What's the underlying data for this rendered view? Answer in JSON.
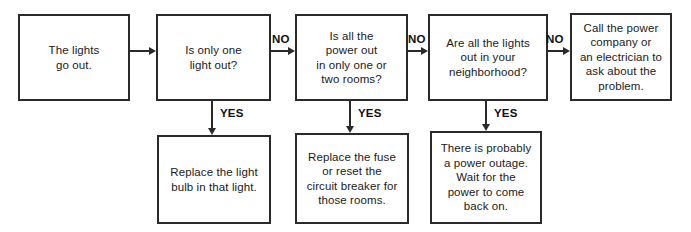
{
  "diagram": {
    "background_color": "#ffffff",
    "line_color": "#2a2a2a",
    "text_color": "#1a1a1a"
  },
  "nodes": [
    {
      "id": "lights-go-out",
      "text": "The lights\ngo out.",
      "x": 18,
      "y": 14,
      "w": 112,
      "h": 87
    },
    {
      "id": "is-only-one-light-out",
      "text": "Is only one\nlight out?",
      "x": 156,
      "y": 14,
      "w": 115,
      "h": 87
    },
    {
      "id": "is-all-power-out-rooms",
      "text": "Is all the\npower out\nin only one or\ntwo rooms?",
      "x": 295,
      "y": 14,
      "w": 113,
      "h": 87
    },
    {
      "id": "are-all-lights-out-neighborhood",
      "text": "Are all the lights\nout in your\nneighborhood?",
      "x": 428,
      "y": 14,
      "w": 120,
      "h": 87
    },
    {
      "id": "call-power-company",
      "text": "Call the power\ncompany or\nan electrician to\nask about the\nproblem.",
      "x": 570,
      "y": 13,
      "w": 102,
      "h": 88
    },
    {
      "id": "replace-light-bulb",
      "text": "Replace the light\nbulb in that light.",
      "x": 157,
      "y": 135,
      "w": 114,
      "h": 89
    },
    {
      "id": "replace-fuse-reset-breaker",
      "text": "Replace the fuse\nor reset the\ncircuit breaker for\nthose rooms.",
      "x": 295,
      "y": 133,
      "w": 114,
      "h": 91
    },
    {
      "id": "power-outage-wait",
      "text": "There is probably\na power outage.\nWait for the\npower to come\nback on.",
      "x": 430,
      "y": 131,
      "w": 112,
      "h": 93
    }
  ],
  "edges": [
    {
      "id": "edge-start-to-q1",
      "label": "",
      "direction": "right",
      "x": 130,
      "y": 51,
      "length": 26
    },
    {
      "id": "edge-q1-no-to-q2",
      "label": "NO",
      "direction": "right",
      "x": 271,
      "y": 51,
      "length": 24,
      "label_x": 272,
      "label_y": 33
    },
    {
      "id": "edge-q2-no-to-q3",
      "label": "NO",
      "direction": "right",
      "x": 408,
      "y": 51,
      "length": 20,
      "label_x": 408,
      "label_y": 33
    },
    {
      "id": "edge-q3-no-to-call",
      "label": "NO",
      "direction": "right",
      "x": 548,
      "y": 51,
      "length": 22,
      "label_x": 546,
      "label_y": 33
    },
    {
      "id": "edge-q1-yes-to-bulb",
      "label": "YES",
      "direction": "down",
      "x": 212,
      "y": 101,
      "length": 34,
      "label_x": 220,
      "label_y": 107
    },
    {
      "id": "edge-q2-yes-to-fuse",
      "label": "YES",
      "direction": "down",
      "x": 350,
      "y": 101,
      "length": 32,
      "label_x": 358,
      "label_y": 107
    },
    {
      "id": "edge-q3-yes-to-outage",
      "label": "YES",
      "direction": "down",
      "x": 486,
      "y": 101,
      "length": 30,
      "label_x": 494,
      "label_y": 107
    }
  ]
}
